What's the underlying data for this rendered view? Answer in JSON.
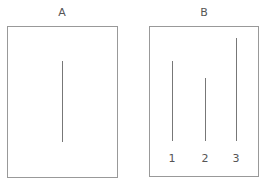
{
  "panels": [
    {
      "label": "A",
      "lines": [
        {
          "x": 62,
          "top": 61,
          "bottom": 142,
          "label": ""
        }
      ]
    },
    {
      "label": "B",
      "lines": [
        {
          "x": 172,
          "top": 61,
          "bottom": 141,
          "label": "1"
        },
        {
          "x": 205,
          "top": 78,
          "bottom": 141,
          "label": "2"
        },
        {
          "x": 236,
          "top": 38,
          "bottom": 141,
          "label": "3"
        }
      ]
    }
  ],
  "colors": {
    "border": "#999999",
    "line": "#777777",
    "text": "#555555"
  }
}
